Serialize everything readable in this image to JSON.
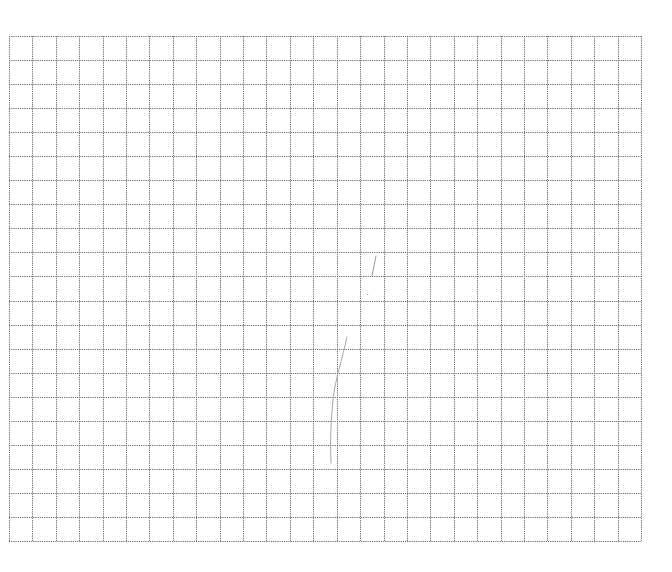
{
  "page": {
    "background": "#ffffff"
  },
  "grid": {
    "left": 9,
    "top": 36,
    "right": 641,
    "bottom": 541,
    "columns": 27,
    "rows": 21,
    "line_color": "#6b6b6b",
    "line_style": "dotted",
    "line_width": 1
  },
  "marks": [
    {
      "name": "pencil-stroke-upper",
      "color": "#9a9a9a",
      "path": "M 376 256 L 372 276"
    },
    {
      "name": "pencil-dot",
      "color": "#b0b0b0",
      "path": "M 367 294 L 368 295"
    },
    {
      "name": "pencil-stroke-lower",
      "color": "#a8a8a8",
      "path": "M 347 337 C 342 360, 335 380, 333 400 C 331 420, 330 440, 331 463"
    }
  ]
}
